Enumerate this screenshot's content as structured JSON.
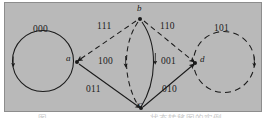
{
  "figure": {
    "type": "state-transition-diagram",
    "background_color": "#b9b9b9",
    "border_color": "#8d8d8d",
    "stroke_color": "#1a1a1a",
    "nodes": [
      {
        "id": "a",
        "label": "a",
        "x": 72,
        "y": 59,
        "label_x": 62,
        "label_y": 54
      },
      {
        "id": "b",
        "label": "b",
        "x": 135,
        "y": 16,
        "label_x": 133,
        "label_y": 3
      },
      {
        "id": "c",
        "label": "c",
        "x": 136,
        "y": 106,
        "label_x": 134,
        "label_y": 106
      },
      {
        "id": "d",
        "label": "d",
        "x": 190,
        "y": 60,
        "label_x": 195,
        "label_y": 55
      }
    ],
    "self_loops": [
      {
        "from": "a",
        "to": "a",
        "label": "000",
        "style": "solid",
        "cx": 40,
        "cy": 60,
        "r": 31,
        "label_x": 30,
        "label_y": 26
      },
      {
        "from": "d",
        "to": "d",
        "label": "101",
        "style": "dashed",
        "cx": 221,
        "cy": 61,
        "r": 31,
        "label_x": 211,
        "label_y": 25
      }
    ],
    "edges": [
      {
        "from": "b",
        "to": "a",
        "label": "111",
        "style": "dashed",
        "label_x": 94,
        "label_y": 22
      },
      {
        "from": "b",
        "to": "d",
        "label": "110",
        "style": "dashed",
        "label_x": 157,
        "label_y": 22
      },
      {
        "from": "b",
        "to": "c",
        "label": "100",
        "style": "dashed",
        "label_x": 95,
        "label_y": 57
      },
      {
        "from": "b",
        "to": "c",
        "label": "001",
        "style": "solid",
        "label_x": 158,
        "label_y": 57
      },
      {
        "from": "a",
        "to": "c",
        "label": "011",
        "style": "solid",
        "label_x": 84,
        "label_y": 84
      },
      {
        "from": "c",
        "to": "d",
        "label": "010",
        "style": "solid",
        "label_x": 160,
        "label_y": 84
      }
    ]
  },
  "caption": {
    "left_fragment": "图",
    "right_fragment": "状态转移图的实例"
  }
}
